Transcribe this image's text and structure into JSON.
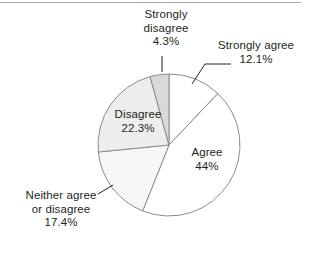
{
  "chart_data": {
    "type": "pie",
    "title": "",
    "subtitle": "",
    "xlabel": "",
    "ylabel": "",
    "legend_position": "none",
    "grid": false,
    "start_angle_deg": 0,
    "direction": "clockwise",
    "units": "percent",
    "categories": [
      "Strongly agree",
      "Agree",
      "Neither agree or disagree",
      "Disagree",
      "Strongly disagree"
    ],
    "values": [
      12.1,
      44,
      17.4,
      22.3,
      4.3
    ],
    "slice_colors": [
      "#ffffff",
      "#ffffff",
      "#f7f7f7",
      "#ededed",
      "#d9d9d9"
    ],
    "slices": [
      {
        "name": "Strongly agree",
        "value": 12.1,
        "value_label": "12.1%",
        "label_line1": "Strongly agree",
        "label_line2": "12.1%",
        "color": "#ffffff",
        "label_placement": "outside",
        "leader": true
      },
      {
        "name": "Agree",
        "value": 44,
        "value_label": "44%",
        "label_line1": "Agree",
        "label_line2": "44%",
        "color": "#ffffff",
        "label_placement": "inside",
        "leader": false
      },
      {
        "name": "Neither agree or disagree",
        "value": 17.4,
        "value_label": "17.4%",
        "label_line1": "Neither agree",
        "label_line2": "or disagree",
        "label_line3": "17.4%",
        "color": "#f7f7f7",
        "label_placement": "outside",
        "leader": true
      },
      {
        "name": "Disagree",
        "value": 22.3,
        "value_label": "22.3%",
        "label_line1": "Disagree",
        "label_line2": "22.3%",
        "color": "#ededed",
        "label_placement": "inside",
        "leader": false
      },
      {
        "name": "Strongly disagree",
        "value": 4.3,
        "value_label": "4.3%",
        "label_line1": "Strongly",
        "label_line2": "disagree",
        "label_line3": "4.3%",
        "color": "#d9d9d9",
        "label_placement": "outside",
        "leader": true
      }
    ],
    "outline_color": "#8c8c8c",
    "background_color": "#ffffff"
  },
  "figure": {
    "center_x": 169,
    "center_y": 145,
    "radius": 71
  }
}
